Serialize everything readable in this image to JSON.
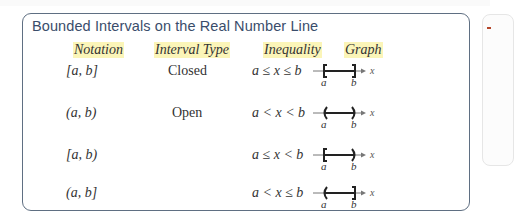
{
  "title": "Bounded Intervals on the Real Number Line",
  "headers": {
    "notation": "Notation",
    "interval_type": "Interval Type",
    "inequality": "Inequality",
    "graph": "Graph"
  },
  "rows": [
    {
      "notation": "[a, b]",
      "type": "Closed",
      "inequality": "a ≤ x ≤ b",
      "left": "[",
      "right": "]",
      "label_a": "a",
      "label_b": "b",
      "axis": "x"
    },
    {
      "notation": "(a, b)",
      "type": "Open",
      "inequality": "a < x < b",
      "left": "(",
      "right": ")",
      "label_a": "a",
      "label_b": "b",
      "axis": "x"
    },
    {
      "notation": "[a, b)",
      "type": "",
      "inequality": "a ≤ x < b",
      "left": "[",
      "right": ")",
      "label_a": "a",
      "label_b": "b",
      "axis": "x"
    },
    {
      "notation": "(a, b]",
      "type": "",
      "inequality": "a < x ≤ b",
      "left": "(",
      "right": "]",
      "label_a": "a",
      "label_b": "b",
      "axis": "x"
    }
  ],
  "colors": {
    "border": "#5f6f82",
    "title": "#3a4d6b",
    "highlight": "#fbf5b8"
  }
}
